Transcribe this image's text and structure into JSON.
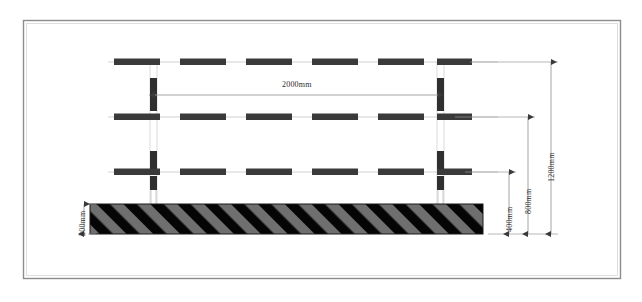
{
  "drawing": {
    "title": "Guardrail Elevation Detail",
    "type": "engineering-elevation-drawing",
    "units": "mm",
    "border": {
      "x": 23,
      "y": 20,
      "width": 597,
      "height": 258,
      "stroke": "#777777"
    },
    "colors": {
      "background": "#ffffff",
      "rail_dash": "#3a3a3a",
      "post": "#2f2f2f",
      "thin_line": "#b8b8b8",
      "dim_line": "#8a8a8a",
      "text": "#2b2b2b",
      "hatch_dark": "#050505",
      "hatch_light": "#6f6f6f",
      "block_border": "#1a1a1a"
    },
    "rails": [
      {
        "name": "top-rail",
        "y": 62,
        "x_start": 108,
        "x_end": 498,
        "dash_count": 6
      },
      {
        "name": "middle-rail",
        "y": 117,
        "x_start": 108,
        "x_end": 498,
        "dash_count": 6
      },
      {
        "name": "bottom-rail",
        "y": 172,
        "x_start": 108,
        "x_end": 498,
        "dash_count": 6
      }
    ],
    "posts": [
      {
        "name": "left-post",
        "x": 153,
        "top": 62,
        "bottom": 205
      },
      {
        "name": "right-post",
        "x": 440,
        "top": 62,
        "bottom": 205
      }
    ],
    "foundation": {
      "name": "concrete-foundation-block",
      "x": 90,
      "y": 204,
      "width": 393,
      "height": 30,
      "hatch_angle_deg": 45
    },
    "dimensions": [
      {
        "id": "span",
        "label": "2000mm",
        "orientation": "horizontal",
        "y": 95,
        "x_start": 155,
        "x_end": 438,
        "label_x": 296,
        "label_y": 85
      },
      {
        "id": "block-thickness",
        "label": "200mm",
        "orientation": "vertical",
        "x": 84,
        "y_start": 204,
        "y_end": 234,
        "label_x": 78,
        "label_y": 234
      },
      {
        "id": "height-400",
        "label": "400mm",
        "orientation": "vertical",
        "x": 509,
        "y_start": 172,
        "y_end": 234,
        "label_x": 504,
        "label_y": 230
      },
      {
        "id": "height-800",
        "label": "800mm",
        "orientation": "vertical",
        "x": 528,
        "y_start": 117,
        "y_end": 234,
        "label_x": 523,
        "label_y": 212
      },
      {
        "id": "height-1200",
        "label": "1200mm",
        "orientation": "vertical",
        "x": 551,
        "y_start": 62,
        "y_end": 234,
        "label_x": 546,
        "label_y": 178
      }
    ],
    "extension_lines": [
      {
        "name": "ext-top-rail",
        "y": 62,
        "x_start": 470,
        "x_end": 556
      },
      {
        "name": "ext-middle-rail",
        "y": 117,
        "x_start": 455,
        "x_end": 533
      },
      {
        "name": "ext-bottom-rail",
        "y": 172,
        "x_start": 465,
        "x_end": 514
      },
      {
        "name": "ext-base",
        "y": 234,
        "x_start": 490,
        "x_end": 556
      }
    ]
  }
}
